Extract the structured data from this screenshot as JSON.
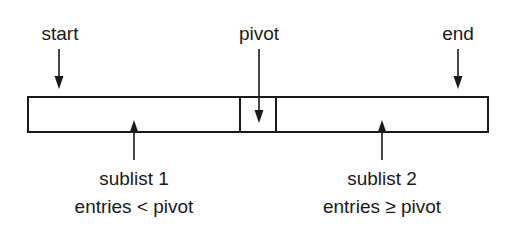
{
  "diagram": {
    "type": "quicksort-partition",
    "colors": {
      "stroke": "#1a1a1a",
      "background": "#ffffff"
    },
    "top_labels": {
      "start": "start",
      "pivot": "pivot",
      "end": "end"
    },
    "bottom_labels": {
      "sublist1": {
        "title": "sublist 1",
        "condition": "entries < pivot"
      },
      "sublist2": {
        "title": "sublist 2",
        "condition": "entries ≥ pivot"
      }
    },
    "array": {
      "segments": [
        "sublist 1",
        "pivot",
        "sublist 2"
      ]
    }
  }
}
